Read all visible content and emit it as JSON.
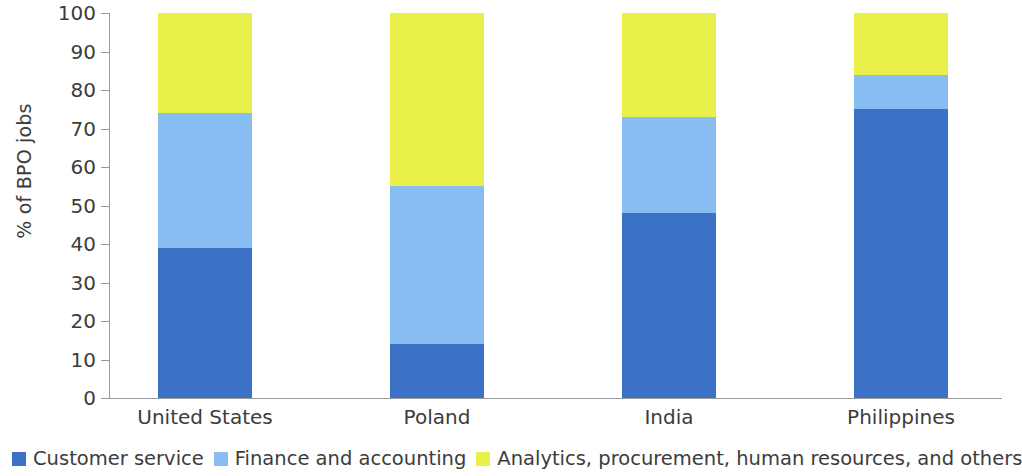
{
  "chart_data": {
    "type": "bar",
    "subtype": "stacked-bar",
    "title": "",
    "xlabel": "",
    "ylabel": "% of BPO jobs",
    "ylim": [
      0,
      100
    ],
    "yticks": [
      0,
      10,
      20,
      30,
      40,
      50,
      60,
      70,
      80,
      90,
      100
    ],
    "ytick_labels": [
      "0",
      "10",
      "20",
      "30",
      "40",
      "50",
      "60",
      "70",
      "80",
      "90",
      "100"
    ],
    "grid": false,
    "legend_position": "bottom-left",
    "categories": [
      "United States",
      "Poland",
      "India",
      "Philippines"
    ],
    "series": [
      {
        "name": "Customer service",
        "color": "#3B72C8",
        "values": [
          39,
          14,
          48,
          75
        ]
      },
      {
        "name": "Finance and accounting",
        "color": "#87BDF0",
        "values": [
          35,
          41,
          25,
          9
        ]
      },
      {
        "name": "Analytics, procurement, human resources, and others",
        "color": "#EAF04A",
        "values": [
          26,
          45,
          27,
          16
        ]
      }
    ],
    "cumulative_tops": {
      "United States": [
        39,
        74,
        100
      ],
      "Poland": [
        14,
        55,
        100
      ],
      "India": [
        48,
        73,
        100
      ],
      "Philippines": [
        75,
        84,
        100
      ]
    }
  },
  "axis": {
    "y_title": "% of BPO jobs",
    "tick_0": "0",
    "tick_10": "10",
    "tick_20": "20",
    "tick_30": "30",
    "tick_40": "40",
    "tick_50": "50",
    "tick_60": "60",
    "tick_70": "70",
    "tick_80": "80",
    "tick_90": "90",
    "tick_100": "100"
  },
  "categories": {
    "united_states": "United States",
    "poland": "Poland",
    "india": "India",
    "philippines": "Philippines"
  },
  "legend": {
    "items": [
      {
        "label": "Customer service",
        "color": "#3B72C8"
      },
      {
        "label": "Finance and accounting",
        "color": "#87BDF0"
      },
      {
        "label": "Analytics, procurement, human resources, and others",
        "color": "#EAF04A"
      }
    ]
  },
  "colors": {
    "customer_service": "#3B72C8",
    "finance_accounting": "#87BDF0",
    "analytics_other": "#EAF04A",
    "axis": "#9A9A9A",
    "text": "#3C3C3C",
    "background": "#FFFFFF"
  }
}
